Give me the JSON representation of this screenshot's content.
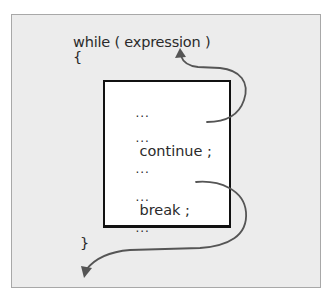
{
  "diagram": {
    "code": {
      "header": "while ( expression )",
      "open_brace": "{",
      "close_brace": "}"
    },
    "body_lines": [
      {
        "prefix": "...",
        "statement": ""
      },
      {
        "prefix": "...",
        "statement": "continue ;"
      },
      {
        "prefix": "...",
        "statement": ""
      },
      {
        "prefix": "...",
        "statement": "break ;"
      },
      {
        "prefix": "...",
        "statement": ""
      }
    ],
    "arrows": [
      {
        "from": "continue ;",
        "to": "while ( expression )",
        "meaning": "jump back to loop condition"
      },
      {
        "from": "break ;",
        "to": "after }",
        "meaning": "exit loop"
      }
    ],
    "colors": {
      "panel_background": "#ececec",
      "panel_border": "#a8a8a8",
      "box_background": "#ffffff",
      "box_border": "#111111",
      "arrow": "#555555",
      "text": "#2a2a2a"
    }
  }
}
